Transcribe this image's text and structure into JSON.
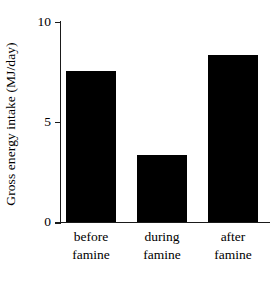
{
  "chart_data": {
    "type": "bar",
    "title": "",
    "subtitle": "",
    "xlabel": "",
    "ylabel": "Gross energy intake (MJ/day)",
    "categories": [
      "before famine",
      "during famine",
      "after famine"
    ],
    "category_lines": [
      [
        "before",
        "famine"
      ],
      [
        "during",
        "famine"
      ],
      [
        "after",
        "famine"
      ]
    ],
    "values": [
      7.5,
      3.3,
      8.3
    ],
    "series": [
      {
        "name": "Gross energy intake",
        "values": [
          7.5,
          3.3,
          8.3
        ],
        "color": "#000000"
      }
    ],
    "ylim": [
      0,
      10
    ],
    "yticks": [
      0,
      5,
      10
    ],
    "ytick_labels": [
      "0",
      "5",
      "10"
    ],
    "grid": false,
    "legend": false,
    "legend_position": "none",
    "bar_color": "#000000",
    "axis_color": "#1a1a1a",
    "background": "#ffffff"
  },
  "figure": {
    "caption_fragment": ""
  }
}
